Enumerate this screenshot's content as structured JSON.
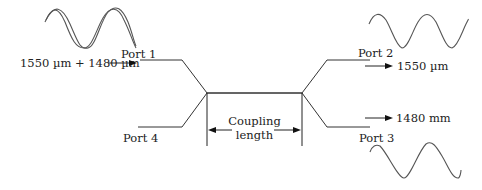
{
  "diagram": {
    "type": "directional-coupler",
    "ports": {
      "port1": {
        "label": "Port 1",
        "signal": "1550 µm + 1480 µm",
        "direction": "input"
      },
      "port2": {
        "label": "Port 2",
        "signal": "1550 µm",
        "direction": "output"
      },
      "port3": {
        "label": "Port 3",
        "signal": "1480 mm",
        "direction": "output"
      },
      "port4": {
        "label": "Port 4"
      }
    },
    "coupling_region": {
      "label_line1": "Coupling",
      "label_line2": "length"
    },
    "waves": {
      "input": "two-superimposed-sinusoids",
      "port2_output": "sinusoid-long-wavelength",
      "port3_output": "sinusoid-short-wavelength"
    },
    "colors": {
      "line": "#333333",
      "wave": "#555555",
      "text": "#222222",
      "background": "#ffffff"
    }
  }
}
